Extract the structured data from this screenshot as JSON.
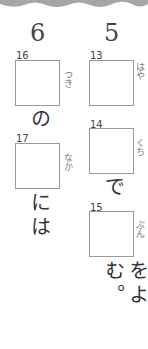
{
  "columns": [
    {
      "number": "6",
      "items": [
        {
          "qnum": "16",
          "ruby": "つき",
          "after": "の"
        },
        {
          "qnum": "17",
          "ruby": "なか",
          "after": "には"
        }
      ]
    },
    {
      "number": "5",
      "items": [
        {
          "qnum": "13",
          "ruby": "はや",
          "after": ""
        },
        {
          "qnum": "14",
          "ruby": "くち",
          "after": "で"
        },
        {
          "qnum": "15",
          "ruby": "ぶん",
          "after": "をよむ。"
        }
      ]
    }
  ],
  "colors": {
    "wave": "#a6a6a6",
    "box_border": "#999999"
  }
}
